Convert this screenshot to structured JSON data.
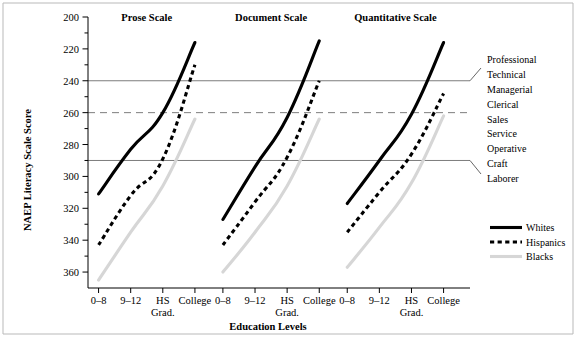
{
  "chart_data": {
    "type": "line",
    "title": "",
    "xlabel": "Education Levels",
    "ylabel": "NAEP Literacy Scale Score",
    "ylim": [
      190,
      360
    ],
    "y_ticks_major": [
      200,
      220,
      240,
      260,
      280,
      300,
      320,
      340,
      360
    ],
    "y_ticks_minor": [
      210,
      230,
      250,
      270,
      290,
      310,
      330,
      350
    ],
    "grid": "horizontal reference lines only",
    "legend_position": "right",
    "reference_lines": [
      {
        "value": 320,
        "style": "solid",
        "color": "#7d7d7d"
      },
      {
        "value": 300,
        "style": "dashed",
        "color": "#7d7d7d"
      },
      {
        "value": 270,
        "style": "solid",
        "color": "#7d7d7d"
      }
    ],
    "categories": [
      "0–8",
      "9–12",
      "HS Grad.",
      "College"
    ],
    "panels": [
      {
        "label": "Prose Scale",
        "series": [
          {
            "name": "Whites",
            "values": [
              249,
              277,
              300,
              344
            ]
          },
          {
            "name": "Hispanics",
            "values": [
              217,
              248,
              271,
              330
            ]
          },
          {
            "name": "Blacks",
            "values": [
              195,
              225,
              254,
              296
            ]
          }
        ]
      },
      {
        "label": "Document Scale",
        "series": [
          {
            "name": "Whites",
            "values": [
              233,
              266,
              297,
              345
            ]
          },
          {
            "name": "Hispanics",
            "values": [
              217,
              244,
              272,
              320
            ]
          },
          {
            "name": "Blacks",
            "values": [
              200,
              225,
              254,
              296
            ]
          }
        ]
      },
      {
        "label": "Quantitative Scale",
        "series": [
          {
            "name": "Whites",
            "values": [
              243,
              270,
              299,
              344
            ]
          },
          {
            "name": "Hispanics",
            "values": [
              225,
              250,
              274,
              312
            ]
          },
          {
            "name": "Blacks",
            "values": [
              203,
              228,
              256,
              298
            ]
          }
        ]
      }
    ],
    "legend": [
      {
        "name": "Whites",
        "style": "solid",
        "color": "#000000"
      },
      {
        "name": "Hispanics",
        "style": "dashed",
        "color": "#000000"
      },
      {
        "name": "Blacks",
        "style": "solid",
        "color": "#d6d6d6"
      }
    ],
    "annotations": {
      "occupation_ladder": [
        "Professional",
        "Technical",
        "Managerial",
        "Clerical",
        "Sales",
        "Service",
        "Operative",
        "Craft",
        "Laborer"
      ]
    }
  },
  "y_axis": {
    "title": "NAEP Literacy Scale Score",
    "labels": [
      "360",
      "340",
      "320",
      "300",
      "280",
      "260",
      "240",
      "220",
      "200"
    ]
  },
  "x_axis": {
    "title": "Education Levels",
    "tick_line1": [
      "0–8",
      "9–12",
      "HS",
      "College"
    ],
    "tick_line2": [
      "",
      "",
      "Grad.",
      ""
    ]
  },
  "panel_titles": [
    "Prose Scale",
    "Document Scale",
    "Quantitative Scale"
  ],
  "occupations": [
    "Professional",
    "Technical",
    "Managerial",
    "Clerical",
    "Sales",
    "Service",
    "Operative",
    "Craft",
    "Laborer"
  ],
  "legend_labels": [
    "Whites",
    "Hispanics",
    "Blacks"
  ]
}
